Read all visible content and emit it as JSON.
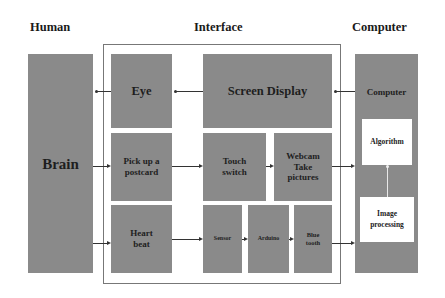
{
  "headers": {
    "human": "Human",
    "interface": "Interface",
    "computer": "Computer"
  },
  "human": {
    "brain": "Brain"
  },
  "interface": {
    "eye": "Eye",
    "screen_display": "Screen Display",
    "pick_up_postcard_line1": "Pick up a",
    "pick_up_postcard_line2": "postcard",
    "touch_switch_line1": "Touch",
    "touch_switch_line2": "switch",
    "webcam_line1": "Webcam",
    "webcam_line2": "Take",
    "webcam_line3": "pictures",
    "heart_beat_line1": "Heart",
    "heart_beat_line2": "beat",
    "sensor": "Sensor",
    "arduino": "Arduino",
    "bluetooth_line1": "Blue",
    "bluetooth_line2": "tooth"
  },
  "computer": {
    "title": "Computer",
    "algorithm": "Algorithm",
    "image_processing_line1": "Image",
    "image_processing_line2": "processing"
  },
  "colors": {
    "box_fill": "#8a8a8a",
    "inner_box_fill": "#ffffff",
    "frame": "#777777",
    "arrow": "#333333"
  }
}
